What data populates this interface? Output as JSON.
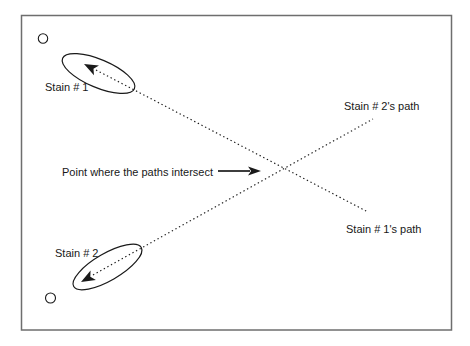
{
  "figure": {
    "colors": {
      "background": "#ffffff",
      "ink": "#1a1a1a",
      "frame_stroke": "#6e6e6e"
    },
    "frame": {
      "x": 21.5,
      "y": 15.5,
      "width": 430,
      "height": 314.5,
      "stroke_width": 1.5
    },
    "labels": [
      {
        "id": "stain-1",
        "text": "Stain # 1",
        "x": 45,
        "y": 91
      },
      {
        "id": "stain-2",
        "text": "Stain # 2",
        "x": 55,
        "y": 257
      },
      {
        "id": "stain-2-path",
        "text": "Stain # 2's path",
        "x": 344,
        "y": 110
      },
      {
        "id": "stain-1-path",
        "text": "Stain # 1's path",
        "x": 346,
        "y": 233
      },
      {
        "id": "intersect-caption",
        "text": "Point where the paths intersect",
        "x": 62,
        "y": 176
      }
    ],
    "font_size_px": 11,
    "reference_circles": [
      {
        "id": "reference-circle-top",
        "cx": 43,
        "cy": 38.5,
        "r": 4.7
      },
      {
        "id": "reference-circle-bottom",
        "cx": 50.5,
        "cy": 298,
        "r": 5
      }
    ],
    "stain_ellipses": [
      {
        "id": "stain-1-ellipse",
        "cx": 98.5,
        "cy": 73.5,
        "rx": 39,
        "ry": 14,
        "rotate_deg": 23
      },
      {
        "id": "stain-2-ellipse",
        "cx": 107.5,
        "cy": 267,
        "rx": 39,
        "ry": 13.5,
        "rotate_deg": -30
      }
    ],
    "dotted_path_lines": [
      {
        "id": "stain-1-path-line",
        "x1": 96,
        "y1": 70,
        "x2": 368,
        "y2": 212
      },
      {
        "id": "stain-2-path-line",
        "x1": 93,
        "y1": 275,
        "x2": 373,
        "y2": 119
      }
    ],
    "direction_arrowheads": [
      {
        "id": "stain-1-direction-arrowhead",
        "tip_x": 84,
        "tip_y": 64,
        "angle_deg": 207,
        "length": 14,
        "half_width": 5.5
      },
      {
        "id": "stain-2-direction-arrowhead",
        "tip_x": 81,
        "tip_y": 282,
        "angle_deg": 151,
        "length": 14,
        "half_width": 5.5
      },
      {
        "id": "intersect-pointer-arrowhead",
        "tip_x": 261,
        "tip_y": 171,
        "angle_deg": 0,
        "length": 13,
        "half_width": 4.5
      }
    ],
    "pointer_line": {
      "x1": 218,
      "y1": 171,
      "x2": 250,
      "y2": 171,
      "stroke_width": 1.7
    },
    "intersection_point": {
      "x": 283,
      "y": 169
    }
  }
}
